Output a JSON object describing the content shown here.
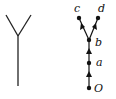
{
  "diagram": {
    "left_shape": {
      "description": "Y-shaped tree (undirected)",
      "color": "#222222"
    },
    "right_tree": {
      "nodes": [
        {
          "id": "O",
          "label": "O"
        },
        {
          "id": "a",
          "label": "a"
        },
        {
          "id": "b",
          "label": "b"
        },
        {
          "id": "c",
          "label": "c"
        },
        {
          "id": "d",
          "label": "d"
        }
      ],
      "edges": [
        {
          "from": "O",
          "to": "a"
        },
        {
          "from": "a",
          "to": "b"
        },
        {
          "from": "b",
          "to": "c"
        },
        {
          "from": "b",
          "to": "d"
        }
      ],
      "color": "#111111"
    }
  }
}
